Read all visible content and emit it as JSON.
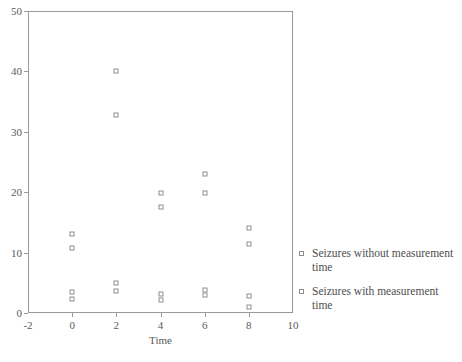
{
  "chart_data": {
    "type": "scatter",
    "title": "",
    "xlabel": "Time",
    "ylabel": "",
    "xlim": [
      -2,
      10
    ],
    "ylim": [
      0,
      50
    ],
    "xticks": [
      -2,
      0,
      2,
      4,
      6,
      8,
      10
    ],
    "xtick_labels": [
      "-2",
      "0",
      "2",
      "4",
      "6",
      "8",
      "10"
    ],
    "yticks": [
      0,
      10,
      20,
      30,
      40,
      50
    ],
    "ytick_labels": [
      "0",
      "10",
      "20",
      "30",
      "40",
      "50"
    ],
    "grid": false,
    "legend_position": "right",
    "marker": "open-square",
    "series": [
      {
        "name": "Seizures without measurement time",
        "marker": "open-square",
        "color": "#8e8e8e",
        "points": [
          {
            "x": 0,
            "y": 13.0
          },
          {
            "x": 2,
            "y": 40.0
          },
          {
            "x": 4,
            "y": 19.8
          },
          {
            "x": 6,
            "y": 23.0
          },
          {
            "x": 8,
            "y": 14.0
          },
          {
            "x": 0,
            "y": 3.5
          },
          {
            "x": 2,
            "y": 5.0
          },
          {
            "x": 4,
            "y": 3.2
          },
          {
            "x": 6,
            "y": 3.8
          },
          {
            "x": 8,
            "y": 2.8
          }
        ]
      },
      {
        "name": "Seizures with measurement time",
        "marker": "open-square",
        "color": "#8e8e8e",
        "points": [
          {
            "x": 0,
            "y": 10.7
          },
          {
            "x": 2,
            "y": 32.7
          },
          {
            "x": 4,
            "y": 17.5
          },
          {
            "x": 6,
            "y": 19.8
          },
          {
            "x": 8,
            "y": 11.5
          },
          {
            "x": 0,
            "y": 2.4
          },
          {
            "x": 2,
            "y": 3.7
          },
          {
            "x": 4,
            "y": 2.2
          },
          {
            "x": 6,
            "y": 2.9
          },
          {
            "x": 8,
            "y": 1.0
          }
        ]
      }
    ]
  },
  "legend": {
    "entries": [
      {
        "label": "Seizures without measurement time"
      },
      {
        "label": "Seizures with measurement time"
      }
    ]
  },
  "axis": {
    "x_title": "Time"
  }
}
